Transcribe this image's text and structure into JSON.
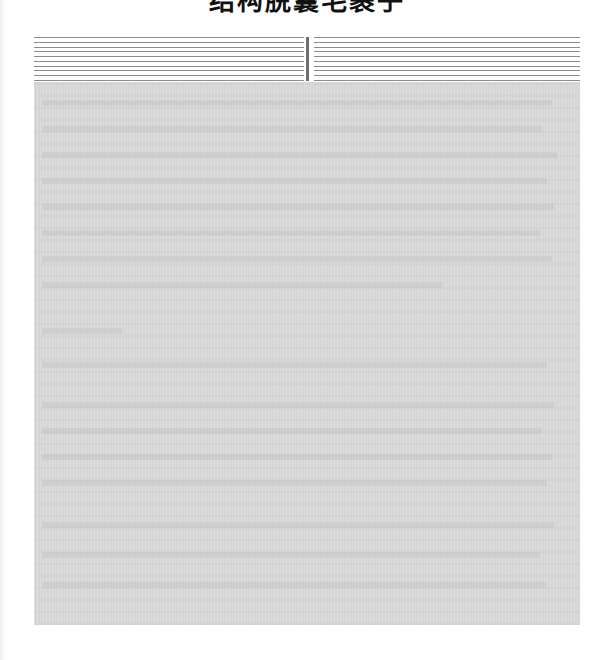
{
  "document": {
    "title": "结构脱囊毛裹子",
    "title_note": "heading partially cropped at top edge"
  },
  "rules_block": {
    "left_rule_count": 10,
    "right_rule_count": 10,
    "rule_color": "#8c8c8c",
    "divider_color": "#6e6e6e"
  },
  "obscured_region": {
    "background_color": "#d6d6d6",
    "ghost_text_lines": [
      {
        "top": 18,
        "width": 510
      },
      {
        "top": 44,
        "width": 500
      },
      {
        "top": 70,
        "width": 515
      },
      {
        "top": 96,
        "width": 505
      },
      {
        "top": 122,
        "width": 512
      },
      {
        "top": 148,
        "width": 498
      },
      {
        "top": 174,
        "width": 510
      },
      {
        "top": 200,
        "width": 400
      },
      {
        "top": 246,
        "width": 80
      },
      {
        "top": 280,
        "width": 505
      },
      {
        "top": 320,
        "width": 512
      },
      {
        "top": 346,
        "width": 500
      },
      {
        "top": 372,
        "width": 510
      },
      {
        "top": 398,
        "width": 505
      },
      {
        "top": 440,
        "width": 512
      },
      {
        "top": 470,
        "width": 498
      },
      {
        "top": 500,
        "width": 505
      }
    ]
  }
}
